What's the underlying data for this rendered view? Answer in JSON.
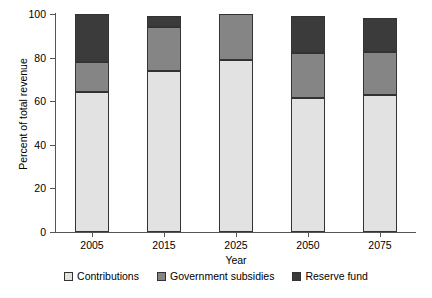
{
  "chart_data": {
    "type": "bar",
    "title": "",
    "subtitle": "",
    "stacked": true,
    "orientation": "vertical",
    "xlabel": "Year",
    "ylabel": "Percent of total revenue",
    "categories": [
      "2005",
      "2015",
      "2025",
      "2050",
      "2075"
    ],
    "ylim": [
      0,
      100
    ],
    "yticks": [
      0,
      20,
      40,
      60,
      80,
      100
    ],
    "ytick_labels": [
      "0",
      "20",
      "40",
      "60",
      "80",
      "100"
    ],
    "grid": false,
    "legend_position": "bottom",
    "series": [
      {
        "name": "Contributions",
        "color": "#e2e2e2",
        "values": [
          64,
          74,
          79,
          61.5,
          63
        ]
      },
      {
        "name": "Government subsidies",
        "color": "#858585",
        "values": [
          14,
          20,
          21,
          20.5,
          19.5
        ]
      },
      {
        "name": "Reserve fund",
        "color": "#3b3b3b",
        "values": [
          22,
          5,
          0,
          17,
          15.5
        ]
      }
    ],
    "totals": [
      100,
      99,
      100,
      99,
      98
    ],
    "annotations": []
  },
  "axes": {
    "y_title": "Percent of total revenue",
    "x_title": "Year"
  },
  "legend": {
    "items": [
      {
        "label": "Contributions",
        "color": "#e2e2e2"
      },
      {
        "label": "Government subsidies",
        "color": "#858585"
      },
      {
        "label": "Reserve fund",
        "color": "#3b3b3b"
      }
    ]
  }
}
